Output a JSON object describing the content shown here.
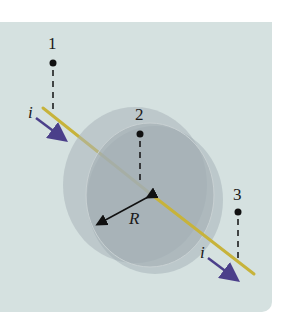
{
  "figure": {
    "type": "diagram",
    "colors": {
      "background": "#d5e1e0",
      "wire": "#c7b33b",
      "current_arrow": "#4b3f8a",
      "disk": "#a9b3b8",
      "points": "#111111"
    },
    "points": [
      {
        "label": "1"
      },
      {
        "label": "2"
      },
      {
        "label": "3"
      }
    ],
    "current_labels": [
      {
        "label": "i"
      },
      {
        "label": "i"
      }
    ],
    "radius_label": "R"
  }
}
